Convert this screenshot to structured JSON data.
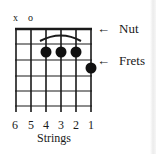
{
  "diagram": {
    "type": "guitar-chord-diagram",
    "open_markers": [
      {
        "string": 6,
        "symbol": "x"
      },
      {
        "string": 5,
        "symbol": "o"
      }
    ],
    "finger_dots": [
      {
        "string": 4,
        "fret": 2
      },
      {
        "string": 3,
        "fret": 2
      },
      {
        "string": 2,
        "fret": 2
      },
      {
        "string": 1,
        "fret": 3
      }
    ],
    "barre_arc": {
      "from_string": 4,
      "to_string": 2,
      "fret": 2
    },
    "string_numbers": [
      "6",
      "5",
      "4",
      "3",
      "2",
      "1"
    ],
    "strings_caption": "Strings",
    "annotations": {
      "nut_label": "Nut",
      "frets_label": "Frets",
      "arrow": "←"
    },
    "colors": {
      "ink": "#1a1a1a",
      "background": "#ffffff"
    }
  }
}
